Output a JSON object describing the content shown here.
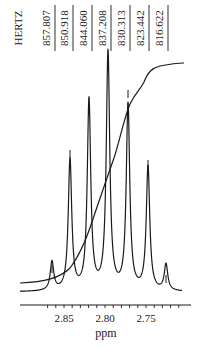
{
  "chart_data": {
    "type": "line",
    "title": "",
    "xlabel": "ppm",
    "ylabel": "",
    "unit_label": "HERTZ",
    "xlim": [
      2.875,
      2.705
    ],
    "x_reversed": true,
    "grid": false,
    "legend": null,
    "x_ticks": [
      {
        "value": 2.85,
        "label": "2.85"
      },
      {
        "value": 2.8,
        "label": "2.80"
      },
      {
        "value": 2.75,
        "label": "2.75"
      }
    ],
    "peak_labels_hz": [
      "857.807",
      "850.918",
      "844.060",
      "837.208",
      "830.313",
      "823.442",
      "816.622"
    ],
    "series": [
      {
        "name": "spectrum",
        "peaks": [
          {
            "ppm": 2.8595,
            "hz": 857.807,
            "rel_height": 0.12
          },
          {
            "ppm": 2.8365,
            "hz": 850.918,
            "rel_height": 0.55
          },
          {
            "ppm": 2.8137,
            "hz": 844.06,
            "rel_height": 0.8
          },
          {
            "ppm": 2.7908,
            "hz": 837.208,
            "rel_height": 1.0
          },
          {
            "ppm": 2.7678,
            "hz": 830.313,
            "rel_height": 0.78
          },
          {
            "ppm": 2.7449,
            "hz": 823.442,
            "rel_height": 0.52
          },
          {
            "ppm": 2.7222,
            "hz": 816.622,
            "rel_height": 0.11
          }
        ]
      },
      {
        "name": "integral",
        "description": "cumulative integral curve rising from left baseline to upper right plateau"
      }
    ]
  }
}
